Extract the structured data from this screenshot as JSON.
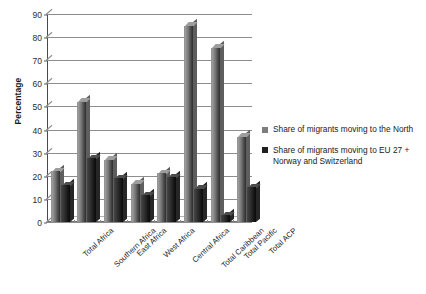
{
  "chart_data": {
    "type": "bar",
    "title": "",
    "xlabel": "",
    "ylabel": "Percentage",
    "ylim": [
      0,
      90
    ],
    "yticks": [
      0,
      10,
      20,
      30,
      40,
      50,
      60,
      70,
      80,
      90
    ],
    "grid": true,
    "legend_position": "right",
    "categories": [
      "Total Africa",
      "Southern Africa",
      "East Africa",
      "West Africa",
      "Central Africa",
      "Total Caribbean",
      "Total Pacific",
      "Total ACP"
    ],
    "series": [
      {
        "name": "Share of migrants moving to the North",
        "color": "#7d7d7d",
        "values": [
          22,
          52,
          27,
          16.5,
          21,
          85,
          75.5,
          37
        ]
      },
      {
        "name": "Share of migrants moving to EU 27 + Norway and Switzerland",
        "color": "#1f1f1f",
        "values": [
          16,
          27.5,
          19,
          11.5,
          19.5,
          14.5,
          3,
          15
        ]
      }
    ]
  },
  "legend": {
    "items": [
      {
        "label": "Share of migrants moving to the North",
        "swatch": "s1"
      },
      {
        "label": "Share of migrants moving to EU 27 + Norway and Switzerland",
        "swatch": "s2"
      }
    ]
  },
  "axes": {
    "y_title": "Percentage"
  }
}
